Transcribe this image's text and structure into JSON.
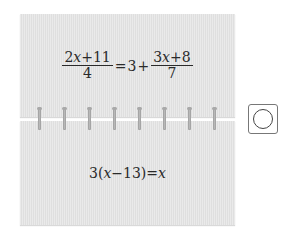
{
  "cards": {
    "top": {
      "equation": {
        "lhs_numerator_coef": "2",
        "lhs_numerator_var": "x",
        "lhs_numerator_rest": "+11",
        "lhs_denominator": "4",
        "equals": "=",
        "constant": "3",
        "plus": "+",
        "rhs_numerator_coef": "3",
        "rhs_numerator_var": "x",
        "rhs_numerator_rest": "+8",
        "rhs_denominator": "7"
      }
    },
    "bottom": {
      "equation": {
        "prefix": "3(",
        "var": "x",
        "middle": "−13)=",
        "rhs_var": "x"
      }
    }
  },
  "rings": {
    "count": 8
  },
  "answer": {
    "symbol": "circle-mark",
    "meaning": "O"
  }
}
